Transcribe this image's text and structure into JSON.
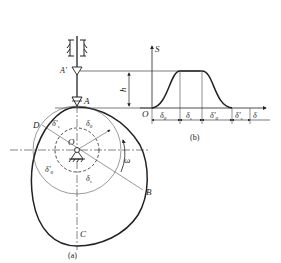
{
  "figure_a": {
    "caption": "(a)",
    "labels": {
      "A_prime": "A'",
      "A": "A",
      "B": "B",
      "C": "C",
      "D": "D",
      "O": "O",
      "h": "h",
      "omega": "ω",
      "delta0": "δ",
      "delta0_sub": "0",
      "deltas": "δ",
      "deltas_sub": "s",
      "delta0p": "δ'",
      "delta0p_sub": "0",
      "deltasp": "δ'",
      "deltasp_sub": "s"
    }
  },
  "figure_b": {
    "caption": "(b)",
    "axis_y": "S",
    "axis_x": "δ",
    "origin": "O",
    "intervals": [
      {
        "sym": "δ",
        "sub": "0"
      },
      {
        "sym": "δ",
        "sub": "s"
      },
      {
        "sym": "δ'",
        "sub": "0"
      },
      {
        "sym": "δ'",
        "sub": "s"
      }
    ]
  }
}
